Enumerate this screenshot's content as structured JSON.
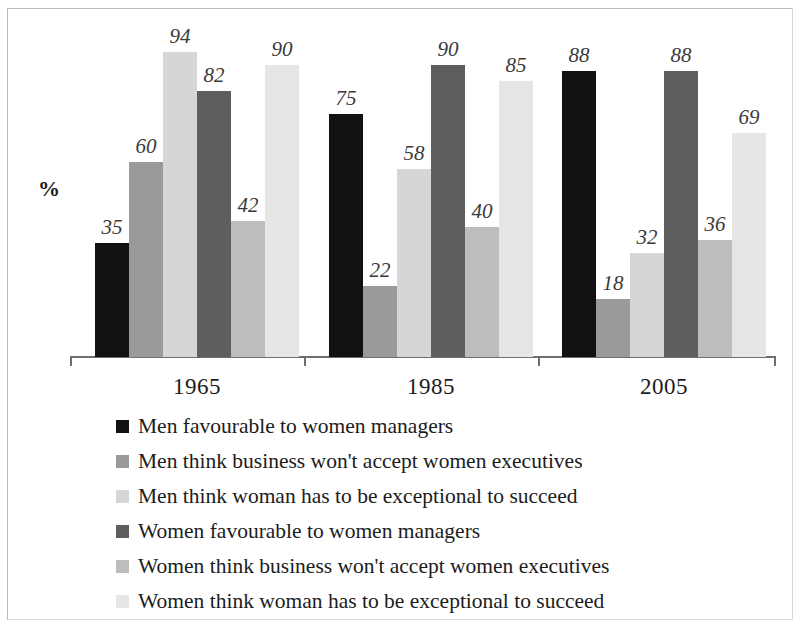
{
  "chart_data": {
    "type": "bar",
    "title": "",
    "subtitle": "",
    "xlabel": "",
    "ylabel": "%",
    "ylim": [
      0,
      100
    ],
    "grid": false,
    "legend_position": "bottom-left",
    "orientation": "vertical",
    "grouping": "grouped",
    "categories": [
      "1965",
      "1985",
      "2005"
    ],
    "series": [
      {
        "name": "Men favourable to women managers",
        "color": "#111111",
        "values": [
          35,
          75,
          88
        ]
      },
      {
        "name": "Men think business won't accept women executives",
        "color": "#9a9a9a",
        "values": [
          60,
          22,
          18
        ]
      },
      {
        "name": "Men think woman has to be exceptional to succeed",
        "color": "#d6d6d6",
        "values": [
          94,
          58,
          32
        ]
      },
      {
        "name": "Women favourable to women managers",
        "color": "#5e5e5e",
        "values": [
          82,
          90,
          88
        ]
      },
      {
        "name": "Women think business won't accept women executives",
        "color": "#bdbdbd",
        "values": [
          42,
          40,
          36
        ]
      },
      {
        "name": "Women think woman has to be exceptional to succeed",
        "color": "#e6e6e6",
        "values": [
          90,
          85,
          69
        ]
      }
    ]
  },
  "axis": {
    "y_unit_label": "%"
  },
  "groups": [
    {
      "label": "1965",
      "values": [
        35,
        60,
        94,
        82,
        42,
        90
      ]
    },
    {
      "label": "1985",
      "values": [
        75,
        22,
        58,
        90,
        40,
        85
      ]
    },
    {
      "label": "2005",
      "values": [
        88,
        18,
        32,
        88,
        36,
        69
      ]
    }
  ],
  "legend": {
    "items": [
      {
        "label": "Men favourable to women managers",
        "color": "#111111"
      },
      {
        "label": "Men think business won't accept women executives",
        "color": "#9a9a9a"
      },
      {
        "label": "Men think woman has to be exceptional to succeed",
        "color": "#d6d6d6"
      },
      {
        "label": "Women favourable to women managers",
        "color": "#5e5e5e"
      },
      {
        "label": "Women think business won't accept women executives",
        "color": "#bdbdbd"
      },
      {
        "label": "Women think woman has to be exceptional to succeed",
        "color": "#e6e6e6"
      }
    ]
  }
}
